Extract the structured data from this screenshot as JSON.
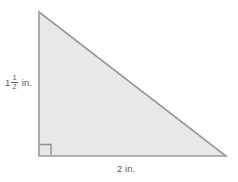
{
  "figure": {
    "name": "right-triangle-diagram",
    "shape": "right triangle",
    "background_color": "#ffffff",
    "fill_color": "#e8e8e8",
    "stroke_color": "#9a9a9a",
    "text_color": "#5c5c5c",
    "vertices": {
      "top": [
        39,
        12
      ],
      "bottom_left": [
        39,
        156
      ],
      "bottom_right": [
        226,
        156
      ]
    },
    "right_angle_marker": {
      "present": true,
      "vertex": "bottom-left",
      "size_px": 11
    },
    "labels": {
      "height": {
        "whole": "1",
        "numerator": "1",
        "denominator": "2",
        "unit": "in."
      },
      "width": {
        "value": "2 in."
      }
    }
  }
}
